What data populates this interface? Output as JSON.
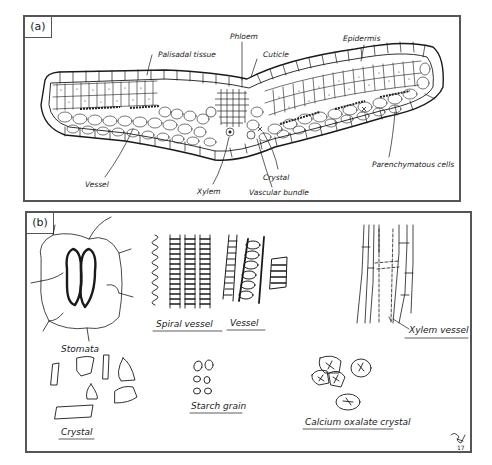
{
  "panel_a": {
    "tag": "(a)",
    "labels": {
      "palisadal_tissue": "Palisadal tissue",
      "phloem": "Phloem",
      "cuticle": "Cuticle",
      "epidermis": "Epidermis",
      "vessel": "Vessel",
      "xylem": "Xylem",
      "crystal": "Crystal",
      "vascular_bundle": "Vascular bundle",
      "parenchymatous_cells": "Parenchymatous cells"
    }
  },
  "panel_b": {
    "tag": "(b)",
    "labels": {
      "stomata": "Stomata",
      "spiral_vessel": "Spiral vessel",
      "vessel": "Vessel",
      "xylem_vessel": "Xylem vessel",
      "crystal": "Crystal",
      "starch_grain": "Starch grain",
      "calcium_oxalate_crystal": "Calcium oxalate crystal"
    },
    "signature": "17"
  }
}
